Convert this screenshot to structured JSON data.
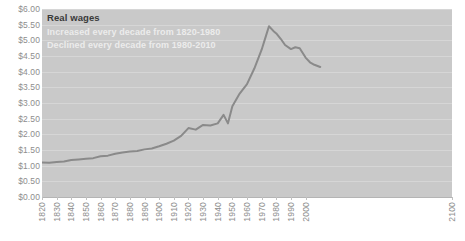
{
  "chart_data": {
    "type": "line",
    "title": "Real wages",
    "subtitles": [
      "Increased every decade from 1820-1980",
      "Declined every decade from 1980-2010"
    ],
    "xlabel": "",
    "ylabel": "",
    "xlim": [
      1820,
      2100
    ],
    "ylim": [
      0.0,
      6.0
    ],
    "grid": true,
    "legend": "none",
    "y_tick_labels": [
      "$6.00",
      "$5.50",
      "$5.00",
      "$4.50",
      "$4.00",
      "$3.50",
      "$3.00",
      "$2.50",
      "$2.00",
      "$1.50",
      "$1.00",
      "$0.50",
      "$0.00"
    ],
    "y_tick_values": [
      6.0,
      5.5,
      5.0,
      4.5,
      4.0,
      3.5,
      3.0,
      2.5,
      2.0,
      1.5,
      1.0,
      0.5,
      0.0
    ],
    "x_tick_labels": [
      "1820",
      "1830",
      "1840",
      "1850",
      "1860",
      "1870",
      "1880",
      "1890",
      "1900",
      "1910",
      "1920",
      "1930",
      "1940",
      "1950",
      "1960",
      "1970",
      "1980",
      "1990",
      "2000",
      "2100"
    ],
    "x_tick_values": [
      1820,
      1830,
      1840,
      1850,
      1860,
      1870,
      1880,
      1890,
      1900,
      1910,
      1920,
      1930,
      1940,
      1950,
      1960,
      1970,
      1980,
      1990,
      2000,
      2100
    ],
    "series": [
      {
        "name": "Real wages",
        "color": "#8a8a8a",
        "x": [
          1820,
          1825,
          1830,
          1835,
          1840,
          1845,
          1850,
          1855,
          1860,
          1865,
          1870,
          1875,
          1880,
          1885,
          1890,
          1895,
          1900,
          1905,
          1910,
          1915,
          1920,
          1925,
          1930,
          1935,
          1940,
          1944,
          1947,
          1950,
          1955,
          1960,
          1965,
          1970,
          1973,
          1975,
          1978,
          1980,
          1983,
          1986,
          1990,
          1993,
          1996,
          2000,
          2003,
          2006,
          2010
        ],
        "values": [
          1.1,
          1.09,
          1.12,
          1.13,
          1.18,
          1.2,
          1.22,
          1.24,
          1.3,
          1.32,
          1.38,
          1.42,
          1.45,
          1.47,
          1.52,
          1.55,
          1.62,
          1.7,
          1.8,
          1.95,
          2.2,
          2.15,
          2.3,
          2.28,
          2.35,
          2.62,
          2.35,
          2.9,
          3.3,
          3.6,
          4.1,
          4.7,
          5.15,
          5.45,
          5.3,
          5.22,
          5.05,
          4.85,
          4.72,
          4.78,
          4.75,
          4.45,
          4.3,
          4.22,
          4.15
        ]
      }
    ]
  },
  "colors": {
    "plot_background": "#c9c9c9",
    "gridline": "#d6d6d6",
    "line": "#8a8a8a",
    "tick_label": "#8d8d8d",
    "title": "#3a3a3a",
    "subtitle": "#ececec"
  }
}
